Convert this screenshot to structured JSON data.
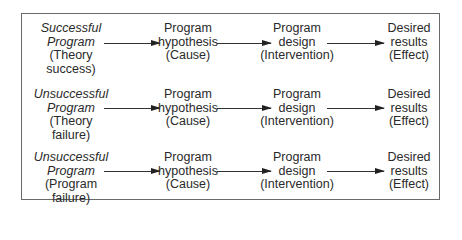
{
  "diagram": {
    "rows": [
      {
        "label_italic": [
          "Successful",
          "Program"
        ],
        "label_plain": [
          "(Theory",
          "success)"
        ],
        "nodes": [
          {
            "lines": [
              "Program",
              "hypothesis",
              "(Cause)"
            ]
          },
          {
            "lines": [
              "Program",
              "design",
              "(Intervention)"
            ]
          },
          {
            "lines": [
              "Desired",
              "results",
              "(Effect)"
            ]
          }
        ]
      },
      {
        "label_italic": [
          "Unsuccessful",
          "Program"
        ],
        "label_plain": [
          "(Theory",
          "failure)"
        ],
        "nodes": [
          {
            "lines": [
              "Program",
              "hypothesis",
              "(Cause)"
            ]
          },
          {
            "lines": [
              "Program",
              "design",
              "(Intervention)"
            ]
          },
          {
            "lines": [
              "Desired",
              "results",
              "(Effect)"
            ]
          }
        ]
      },
      {
        "label_italic": [
          "Unsuccessful",
          "Program"
        ],
        "label_plain": [
          "(Program",
          "failure)"
        ],
        "nodes": [
          {
            "lines": [
              "Program",
              "hypothesis",
              "(Cause)"
            ]
          },
          {
            "lines": [
              "Program",
              "design",
              "(Intervention)"
            ]
          },
          {
            "lines": [
              "Desired",
              "results",
              "(Effect)"
            ]
          }
        ]
      }
    ],
    "arrow_icon": "right-arrow-icon",
    "colors": {
      "border": "#6a6a6a",
      "text": "#2a2a2a",
      "arrow": "#222222"
    }
  }
}
